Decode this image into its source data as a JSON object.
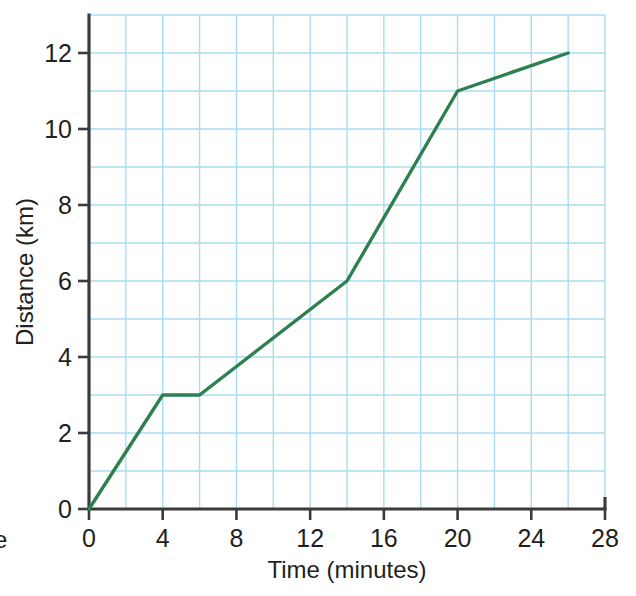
{
  "chart_data": {
    "type": "line",
    "title": "",
    "subtitle": "",
    "xlabel": "Time (minutes)",
    "ylabel": "Distance (km)",
    "xlim": [
      0,
      28
    ],
    "ylim": [
      0,
      13
    ],
    "x_ticks": [
      0,
      4,
      8,
      12,
      16,
      20,
      24,
      28
    ],
    "x_tick_labels": [
      "0",
      "4",
      "8",
      "12",
      "16",
      "20",
      "24",
      "28"
    ],
    "y_ticks": [
      0,
      2,
      4,
      6,
      8,
      10,
      12
    ],
    "y_tick_labels": [
      "0",
      "2",
      "4",
      "6",
      "8",
      "10",
      "12"
    ],
    "x_gridline_step": 2,
    "y_gridline_step": 1,
    "grid": true,
    "grid_color": "#a9dcf2",
    "legend": false,
    "legend_position": "none",
    "line_color": "#2d8050",
    "line_width": 3,
    "series": [
      {
        "name": "journey",
        "points": [
          {
            "x": 0,
            "y": 0
          },
          {
            "x": 4,
            "y": 3
          },
          {
            "x": 6,
            "y": 3
          },
          {
            "x": 14,
            "y": 6
          },
          {
            "x": 20,
            "y": 11
          },
          {
            "x": 26,
            "y": 12
          }
        ],
        "x": [
          0,
          4,
          6,
          14,
          20,
          26
        ],
        "values": [
          0,
          3,
          3,
          6,
          11,
          12
        ]
      }
    ],
    "annotations": []
  },
  "margin_text": {
    "cropped_letter": "e"
  },
  "colors": {
    "axis": "#3b3b3b",
    "grid": "#a9dcf2",
    "line": "#2d8050",
    "text": "#231f20",
    "background": "#ffffff"
  }
}
